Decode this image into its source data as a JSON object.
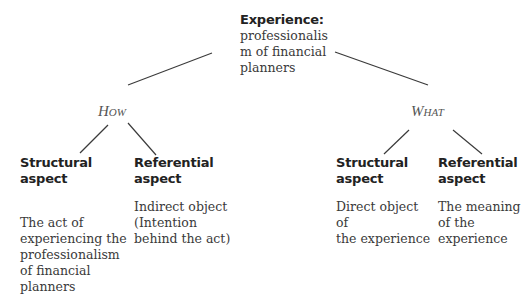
{
  "root": {
    "title": "Experience:",
    "lines": [
      "professionalis",
      "m of financial",
      "planners"
    ]
  },
  "branches": {
    "how": {
      "label": "How"
    },
    "what": {
      "label": "What"
    }
  },
  "leaves": {
    "how_structural": {
      "heading": "Structural aspect",
      "lines": [
        "The act of",
        "experiencing the",
        "professionalism",
        "of financial",
        "planners"
      ]
    },
    "how_referential": {
      "heading_lines": [
        "Referential",
        "aspect"
      ],
      "lines": [
        "Indirect object",
        "(Intention",
        "behind the act)"
      ]
    },
    "what_structural": {
      "heading_lines": [
        "Structural",
        "aspect"
      ],
      "lines": [
        "Direct object of",
        "the experience"
      ]
    },
    "what_referential": {
      "heading_lines": [
        "Referential",
        "aspect"
      ],
      "lines": [
        "The meaning",
        "of the",
        "experience"
      ]
    }
  },
  "colors": {
    "line": "#3a3a3a",
    "text": "#2a2a2a",
    "branch": "#555555"
  }
}
